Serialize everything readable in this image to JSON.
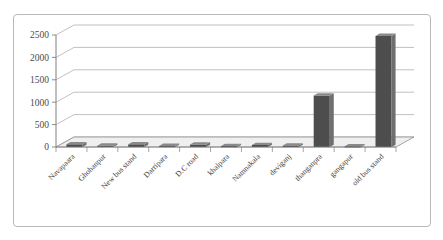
{
  "chart_data": {
    "type": "bar",
    "title": "",
    "subtitle": "",
    "xlabel": "",
    "ylabel": "",
    "ylim": [
      0,
      2500
    ],
    "ytick_labels": [
      "0",
      "500",
      "1000",
      "1500",
      "2000",
      "2500"
    ],
    "ytick_values": [
      0,
      500,
      1000,
      1500,
      2000,
      2500
    ],
    "grid": true,
    "legend": false,
    "legend_position": "none",
    "style": "3d-column",
    "bar_color": "#4d4d4d",
    "bar_side_color": "#6f6f6f",
    "bar_top_color": "#8a8a8a",
    "floor_color": "#efefef",
    "grid_color": "#a6a6a6",
    "axis_color": "#808080",
    "categories": [
      "Navapaara",
      "Ghohanpur",
      "New bus stand",
      "Darripara",
      "D.C road",
      "khalpara",
      "Namnakala",
      "deviganj",
      "thanganpra",
      "gangapur",
      "old bus stand"
    ],
    "values": [
      60,
      30,
      60,
      25,
      55,
      22,
      45,
      35,
      1150,
      18,
      2480
    ],
    "series": [
      {
        "name": "",
        "values": [
          60,
          30,
          60,
          25,
          55,
          22,
          45,
          35,
          1150,
          18,
          2480
        ]
      }
    ]
  }
}
